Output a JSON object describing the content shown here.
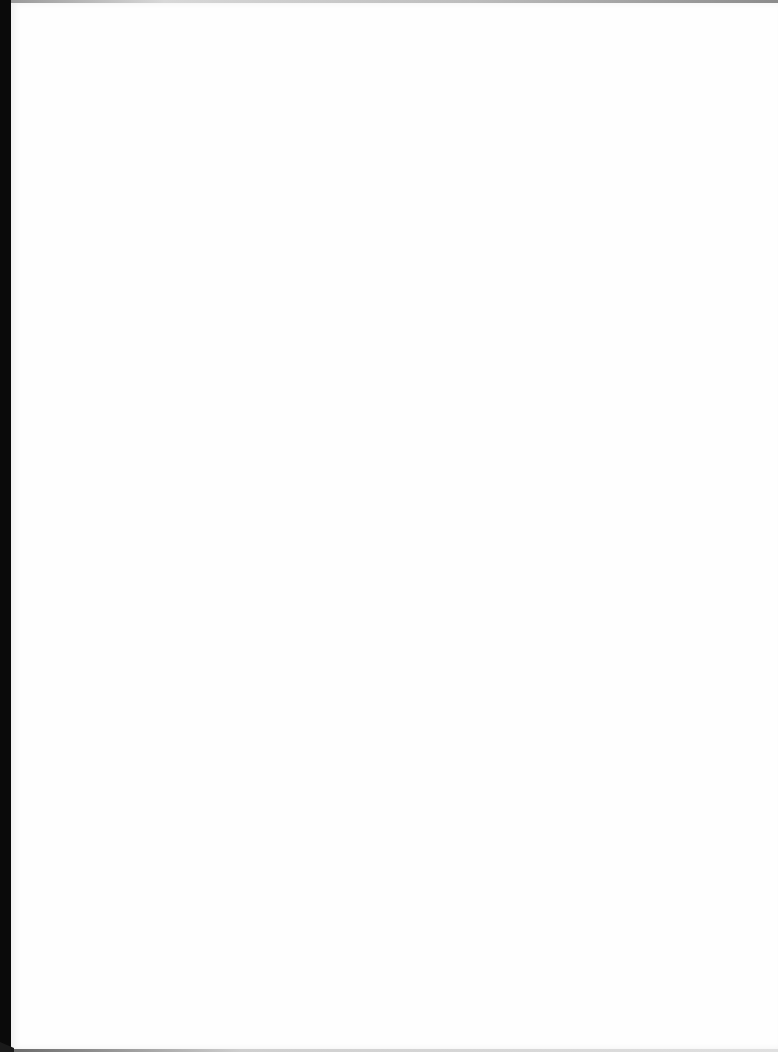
{
  "page": {
    "type": "blank-scanned-page",
    "background_color": "#ffffff",
    "edge_color": "#0a0a0a",
    "text": ""
  }
}
